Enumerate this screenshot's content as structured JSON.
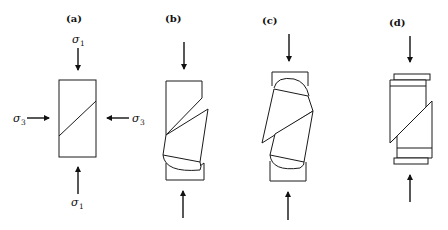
{
  "figure": {
    "panels": [
      {
        "id": "a",
        "label": "(a)",
        "description": "Intact specimen with inclined joint under triaxial stress"
      },
      {
        "id": "b",
        "label": "(b)",
        "description": "Sliding on joint with lower spherical seat rotation"
      },
      {
        "id": "c",
        "label": "(c)",
        "description": "Sliding on joint with both spherical seats rotating"
      },
      {
        "id": "d",
        "label": "(d)",
        "description": "Sliding on joint with lateral platen translation"
      }
    ],
    "stress_labels": {
      "sigma1_symbol": "σ",
      "sigma1_sub": "1",
      "sigma3_symbol": "σ",
      "sigma3_sub": "3"
    },
    "colors": {
      "line": "#1a1a1a",
      "background": "#ffffff"
    }
  }
}
